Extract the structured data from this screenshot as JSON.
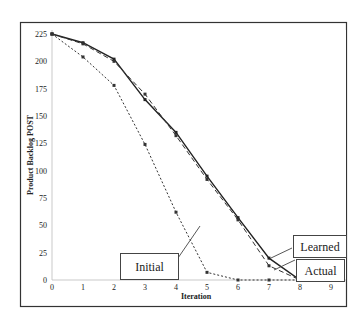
{
  "chart_data": {
    "type": "line",
    "title": "",
    "xlabel": "Iteration",
    "ylabel": "Product Backlog POST",
    "x": [
      0,
      1,
      2,
      3,
      4,
      5,
      6,
      7,
      8,
      9
    ],
    "xticks": [
      "0",
      "1",
      "2",
      "3",
      "4",
      "5",
      "6",
      "7",
      "8",
      "9"
    ],
    "yticks": [
      "0",
      "25",
      "50",
      "75",
      "100",
      "125",
      "150",
      "175",
      "200",
      "225"
    ],
    "ylim": [
      0,
      225
    ],
    "xlim": [
      0,
      9
    ],
    "grid": false,
    "series": [
      {
        "name": "Learned",
        "style": "solid",
        "color": "#222222",
        "values": [
          225,
          217,
          202,
          165,
          135,
          95,
          57,
          20,
          0,
          0
        ]
      },
      {
        "name": "Actual",
        "style": "dashed",
        "color": "#333333",
        "values": [
          225,
          216,
          200,
          170,
          132,
          92,
          55,
          13,
          0,
          0
        ]
      },
      {
        "name": "Initial",
        "style": "dotted",
        "color": "#333333",
        "values": [
          225,
          204,
          178,
          124,
          62,
          7,
          0,
          0,
          0,
          0
        ]
      }
    ],
    "annotations": [
      {
        "label": "Learned",
        "box": [
          293,
          235,
          53,
          22
        ],
        "pointer": [
          [
            271,
            258
          ],
          [
            292,
            248
          ]
        ]
      },
      {
        "label": "Actual",
        "box": [
          296,
          259,
          48,
          22
        ],
        "pointer": [
          [
            274,
            270
          ],
          [
            295,
            260
          ]
        ]
      },
      {
        "label": "Initial",
        "box": [
          120,
          253,
          58,
          26
        ],
        "pointer": [
          [
            178,
            258
          ],
          [
            200,
            226
          ]
        ]
      }
    ]
  }
}
